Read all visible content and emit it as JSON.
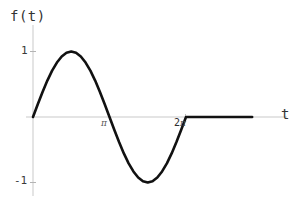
{
  "figure": {
    "background_color": "#ffffff",
    "axis_color": "#c9c9c9",
    "curve_color": "#111111",
    "text_color": "#3c3c3c"
  },
  "labels": {
    "y_axis_label": "f(t)",
    "x_axis_label": "t",
    "y_tick_positive": "1",
    "y_tick_negative": "-1",
    "x_tick_pi": "π",
    "x_tick_2pi_number": "2",
    "x_tick_2pi_symbol": "π"
  },
  "chart_data": {
    "type": "line",
    "title": "",
    "xlabel": "t",
    "ylabel": "f(t)",
    "xlim": [
      -0.3,
      9.2
    ],
    "ylim": [
      -1.35,
      1.35
    ],
    "grid": false,
    "legend": null,
    "xticks": [
      3.14159,
      6.28319
    ],
    "xtick_labels": [
      "π",
      "2π"
    ],
    "yticks": [
      -1,
      1
    ],
    "ytick_labels": [
      "-1",
      "1"
    ],
    "series": [
      {
        "name": "f(t)",
        "color": "#111111",
        "linewidth": 2.6,
        "x": [
          0,
          0.1963,
          0.3927,
          0.589,
          0.7854,
          0.9817,
          1.1781,
          1.3744,
          1.5708,
          1.7671,
          1.9635,
          2.1598,
          2.3562,
          2.5525,
          2.7489,
          2.9452,
          3.14159,
          3.3379,
          3.5343,
          3.7306,
          3.927,
          4.1233,
          4.3197,
          4.516,
          4.7124,
          4.9087,
          5.1051,
          5.3014,
          5.4978,
          5.6941,
          5.8905,
          6.0868,
          6.28319,
          6.8,
          7.4,
          8.0,
          8.6,
          9.0
        ],
        "y": [
          0,
          0.1951,
          0.3827,
          0.5556,
          0.7071,
          0.8315,
          0.9239,
          0.9808,
          1.0,
          0.9808,
          0.9239,
          0.8315,
          0.7071,
          0.5556,
          0.3827,
          0.1951,
          0.0,
          -0.1951,
          -0.3827,
          -0.5556,
          -0.7071,
          -0.8315,
          -0.9239,
          -0.9808,
          -1.0,
          -0.9808,
          -0.9239,
          -0.8315,
          -0.7071,
          -0.5556,
          -0.3827,
          -0.1951,
          0.0,
          0,
          0,
          0,
          0,
          0
        ]
      }
    ],
    "key_points": {
      "start": [
        0,
        0
      ],
      "maximum": [
        1.5708,
        1
      ],
      "zero_crossing": [
        3.14159,
        0
      ],
      "minimum": [
        4.7124,
        -1
      ],
      "period_end": [
        6.28319,
        0
      ],
      "flat_end": [
        9.0,
        0
      ]
    }
  }
}
